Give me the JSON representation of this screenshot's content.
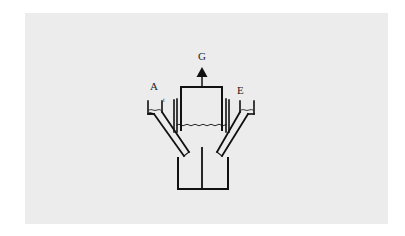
{
  "diagram": {
    "type": "apparatus-schematic",
    "colors": {
      "background": "#ffffff",
      "panel": "#ececec",
      "ink": "#111111"
    },
    "labels": {
      "left_inlet": "A",
      "right_inlet": "E",
      "gas_outlet": "G",
      "left_small_mark": "t",
      "right_small_mark": "r"
    },
    "components": [
      {
        "id": "left-funnel",
        "label": "A"
      },
      {
        "id": "right-funnel",
        "label": "E"
      },
      {
        "id": "gas-collection-chamber",
        "label": "G"
      },
      {
        "id": "lower-divided-vessel"
      }
    ]
  }
}
